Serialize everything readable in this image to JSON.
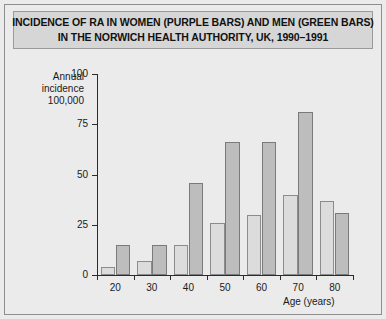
{
  "figure": {
    "title_line_1": "INCIDENCE OF RA IN WOMEN (PURPLE BARS) AND MEN (GREEN BARS)",
    "title_line_2": "IN THE NORWICH HEALTH AUTHORITY, UK, 1990–1991",
    "background_color": "#ebebeb",
    "banner_color": "#d6d6d6"
  },
  "chart_data": {
    "type": "bar",
    "title": "INCIDENCE OF RA IN WOMEN (PURPLE BARS) AND MEN (GREEN BARS) IN THE NORWICH HEALTH AUTHORITY, UK, 1990–1991",
    "categories": [
      "20",
      "30",
      "40",
      "50",
      "60",
      "70",
      "80"
    ],
    "series": [
      {
        "name": "Men (green bars)",
        "values": [
          4,
          7,
          15,
          26,
          30,
          40,
          37
        ],
        "color": "#dcdcdc"
      },
      {
        "name": "Women (purple bars)",
        "values": [
          15,
          15,
          46,
          66,
          66,
          81,
          31
        ],
        "color": "#bdbdbd"
      }
    ],
    "xlabel": "Age (years)",
    "ylabel": "Annual incidence 100,000",
    "ylabel_lines": [
      "Annual",
      "incidence",
      "100,000"
    ],
    "ylim": [
      0,
      100
    ],
    "yticks": [
      0,
      25,
      50,
      75,
      100
    ],
    "ytick_labels": [
      "0",
      "25",
      "50",
      "75",
      "100"
    ],
    "xtick_labels": [
      "20",
      "30",
      "40",
      "50",
      "60",
      "70",
      "80"
    ],
    "grid": false,
    "legend": "in-title"
  }
}
